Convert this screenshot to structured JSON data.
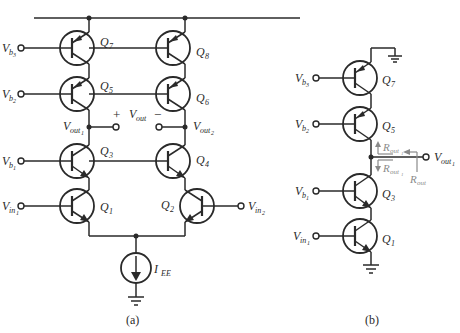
{
  "figure_a": {
    "caption": "(a)",
    "transistors": [
      {
        "name": "Q",
        "sub": "7",
        "type": "pnp"
      },
      {
        "name": "Q",
        "sub": "8",
        "type": "pnp"
      },
      {
        "name": "Q",
        "sub": "5",
        "type": "pnp"
      },
      {
        "name": "Q",
        "sub": "6",
        "type": "pnp"
      },
      {
        "name": "Q",
        "sub": "3",
        "type": "npn"
      },
      {
        "name": "Q",
        "sub": "4",
        "type": "npn"
      },
      {
        "name": "Q",
        "sub": "1",
        "type": "npn"
      },
      {
        "name": "Q",
        "sub": "2",
        "type": "npn"
      }
    ],
    "inputs": [
      {
        "name": "V",
        "sub": "b",
        "sub2": "3"
      },
      {
        "name": "V",
        "sub": "b",
        "sub2": "2"
      },
      {
        "name": "V",
        "sub": "b",
        "sub2": "1"
      },
      {
        "name": "V",
        "sub": "in",
        "sub2": "1"
      },
      {
        "name": "V",
        "sub": "in",
        "sub2": "2"
      }
    ],
    "outputs": {
      "vout1": {
        "name": "V",
        "sub": "out",
        "sub2": "1"
      },
      "vout2": {
        "name": "V",
        "sub": "out",
        "sub2": "2"
      },
      "vout": {
        "name": "V",
        "sub": "out",
        "plus": "+",
        "minus": "−"
      }
    },
    "current_source": {
      "name": "I",
      "sub": "EE"
    }
  },
  "figure_b": {
    "caption": "(b)",
    "transistors": [
      {
        "name": "Q",
        "sub": "7"
      },
      {
        "name": "Q",
        "sub": "5"
      },
      {
        "name": "Q",
        "sub": "3"
      },
      {
        "name": "Q",
        "sub": "1"
      }
    ],
    "inputs": [
      {
        "name": "V",
        "sub": "b",
        "sub2": "3"
      },
      {
        "name": "V",
        "sub": "b",
        "sub2": "2"
      },
      {
        "name": "V",
        "sub": "b",
        "sub2": "1"
      },
      {
        "name": "V",
        "sub": "in",
        "sub2": "1"
      }
    ],
    "output": {
      "name": "V",
      "sub": "out",
      "sub2": "1"
    },
    "resistances": [
      {
        "name": "R",
        "sub": "out",
        "sub2": "1"
      },
      {
        "name": "R",
        "sub": "out",
        "sub2": "1"
      },
      {
        "name": "R",
        "sub": "out"
      }
    ]
  },
  "colors": {
    "line": "#2a2a2a",
    "annotation": "#8a8a8a",
    "background": "#ffffff"
  }
}
